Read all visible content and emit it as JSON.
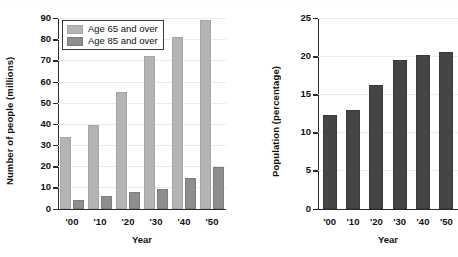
{
  "figure": {
    "background": "#ffffff",
    "bar_light_color": "#b4b4b4",
    "bar_dark_color": "#8e8e8e",
    "bar_solid_color": "#454545",
    "axis_color": "#2b2b2b",
    "grid_color": "#ececec"
  },
  "chart_data": [
    {
      "type": "bar",
      "title": "",
      "xlabel": "Year",
      "ylabel": "Number of people (millions)",
      "categories": [
        "'00",
        "'10",
        "'20",
        "'30",
        "'40",
        "'50"
      ],
      "yticks": [
        0,
        10,
        20,
        30,
        40,
        50,
        60,
        70,
        80,
        90
      ],
      "ylim": [
        0,
        90
      ],
      "grid": true,
      "legend_position": "upper-left",
      "series": [
        {
          "name": "Age 65 and over",
          "color": "#b4b4b4",
          "values": [
            34,
            39.5,
            55,
            72,
            81,
            89
          ]
        },
        {
          "name": "Age 85 and over",
          "color": "#8e8e8e",
          "values": [
            4.2,
            6,
            7.8,
            9.3,
            14.5,
            19.5
          ]
        }
      ]
    },
    {
      "type": "bar",
      "title": "",
      "xlabel": "Year",
      "ylabel": "Population (percentage)",
      "categories": [
        "'00",
        "'10",
        "'20",
        "'30",
        "'40",
        "'50"
      ],
      "yticks": [
        0,
        5,
        10,
        15,
        20,
        25
      ],
      "ylim": [
        0,
        25
      ],
      "grid": true,
      "legend_position": "none",
      "series": [
        {
          "name": "Population (percentage)",
          "color": "#454545",
          "values": [
            12.3,
            13.0,
            16.2,
            19.5,
            20.1,
            20.6
          ]
        }
      ]
    }
  ],
  "legend": {
    "items": [
      {
        "label": "Age 65 and over",
        "swatch": "light"
      },
      {
        "label": "Age 85 and over",
        "swatch": "dark"
      }
    ]
  }
}
